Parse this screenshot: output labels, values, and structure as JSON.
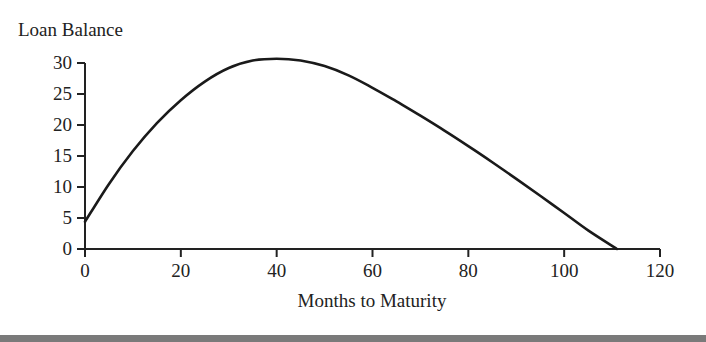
{
  "chart_data": {
    "type": "line",
    "title": "",
    "xlabel": "Months to Maturity",
    "ylabel": "Loan Balance",
    "xlim": [
      0,
      120
    ],
    "ylim": [
      0,
      30
    ],
    "x_ticks": [
      0,
      20,
      40,
      60,
      80,
      100,
      120
    ],
    "y_ticks": [
      0,
      5,
      10,
      15,
      20,
      25,
      30
    ],
    "grid": false,
    "legend": null,
    "series": [
      {
        "name": "Loan Balance",
        "x": [
          0,
          5,
          10,
          15,
          20,
          25,
          30,
          35,
          40,
          45,
          50,
          55,
          60,
          65,
          70,
          75,
          80,
          85,
          90,
          95,
          100,
          105,
          111
        ],
        "y": [
          4.4,
          10.5,
          15.8,
          20.3,
          24.0,
          27.0,
          29.2,
          30.4,
          30.7,
          30.4,
          29.5,
          28.0,
          26.0,
          23.8,
          21.5,
          19.1,
          16.6,
          14.0,
          11.3,
          8.6,
          5.8,
          3.0,
          0
        ]
      }
    ],
    "color": "#1a1a1a"
  }
}
